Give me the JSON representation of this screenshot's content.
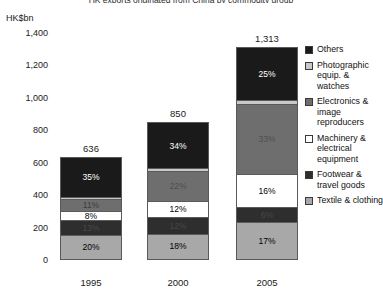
{
  "title": "HK exports originated from China by commodity group",
  "axis": {
    "unit_label": "HK$bn",
    "yticks": [
      "1,400",
      "1,200",
      "1,000",
      "800",
      "600",
      "400",
      "200",
      "0"
    ]
  },
  "legend": [
    {
      "label": "Others",
      "color": "#1a1a1a"
    },
    {
      "label": "Photographic equip. & watches",
      "color": "#c9c9c9"
    },
    {
      "label": "Electronics & image reproducers",
      "color": "#6e6e6e"
    },
    {
      "label": "Machinery & electrical equipment",
      "color": "#ffffff"
    },
    {
      "label": "Footwear & travel goods",
      "color": "#2e2e2e"
    },
    {
      "label": "Textile & clothing",
      "color": "#a8a8a8"
    }
  ],
  "bars": [
    {
      "year": "1995",
      "total": "636",
      "segments": [
        {
          "name": "Others",
          "label": "35%",
          "value": 35,
          "color": "#1a1a1a",
          "text_color": "#ffffff"
        },
        {
          "name": "Photographic equip. & watches",
          "label": "",
          "value": 2,
          "color": "#c9c9c9",
          "text_color": "#000000"
        },
        {
          "name": "Electronics & image reproducers",
          "label": "11%",
          "value": 11,
          "color": "#6e6e6e",
          "text_color": "#3d3d3d"
        },
        {
          "name": "Machinery & electrical equipment",
          "label": "8%",
          "value": 8,
          "color": "#ffffff",
          "text_color": "#000000"
        },
        {
          "name": "Footwear & travel goods",
          "label": "13%",
          "value": 13,
          "color": "#2e2e2e",
          "text_color": "#4a4a4a"
        },
        {
          "name": "Textile & clothing",
          "label": "20%",
          "value": 20,
          "color": "#a8a8a8",
          "text_color": "#000000"
        }
      ]
    },
    {
      "year": "2000",
      "total": "850",
      "segments": [
        {
          "name": "Others",
          "label": "34%",
          "value": 34,
          "color": "#1a1a1a",
          "text_color": "#ffffff"
        },
        {
          "name": "Photographic equip. & watches",
          "label": "",
          "value": 2,
          "color": "#c9c9c9",
          "text_color": "#000000"
        },
        {
          "name": "Electronics & image reproducers",
          "label": "22%",
          "value": 22,
          "color": "#6e6e6e",
          "text_color": "#4e4e4e"
        },
        {
          "name": "Machinery & electrical equipment",
          "label": "12%",
          "value": 12,
          "color": "#ffffff",
          "text_color": "#000000"
        },
        {
          "name": "Footwear & travel goods",
          "label": "12%",
          "value": 12,
          "color": "#2e2e2e",
          "text_color": "#474747"
        },
        {
          "name": "Textile & clothing",
          "label": "18%",
          "value": 18,
          "color": "#a8a8a8",
          "text_color": "#000000"
        }
      ]
    },
    {
      "year": "2005",
      "total": "1,313",
      "segments": [
        {
          "name": "Others",
          "label": "25%",
          "value": 25,
          "color": "#1a1a1a",
          "text_color": "#ffffff"
        },
        {
          "name": "Photographic equip. & watches",
          "label": "",
          "value": 2,
          "color": "#c9c9c9",
          "text_color": "#000000"
        },
        {
          "name": "Electronics & image reproducers",
          "label": "33%",
          "value": 33,
          "color": "#6e6e6e",
          "text_color": "#4e4e4e"
        },
        {
          "name": "Machinery & electrical equipment",
          "label": "16%",
          "value": 16,
          "color": "#ffffff",
          "text_color": "#000000"
        },
        {
          "name": "Footwear & travel goods",
          "label": "6%",
          "value": 7,
          "color": "#2e2e2e",
          "text_color": "#474747"
        },
        {
          "name": "Textile & clothing",
          "label": "17%",
          "value": 17,
          "color": "#a8a8a8",
          "text_color": "#000000"
        }
      ]
    }
  ],
  "chart_data": {
    "type": "bar",
    "title": "HK exports originated from China by commodity group",
    "xlabel": "",
    "ylabel": "HK$bn",
    "ylim": [
      0,
      1400
    ],
    "ytick_values": [
      0,
      200,
      400,
      600,
      800,
      1000,
      1200,
      1400
    ],
    "grid": false,
    "stacked": true,
    "legend_position": "right",
    "categories": [
      "1995",
      "2000",
      "2005"
    ],
    "totals": [
      636,
      850,
      1313
    ],
    "value_unit": "percent of bar total",
    "series": [
      {
        "name": "Textile & clothing",
        "values": [
          20,
          18,
          17
        ]
      },
      {
        "name": "Footwear & travel goods",
        "values": [
          13,
          12,
          6
        ]
      },
      {
        "name": "Machinery & electrical equipment",
        "values": [
          8,
          12,
          16
        ]
      },
      {
        "name": "Electronics & image reproducers",
        "values": [
          11,
          22,
          33
        ]
      },
      {
        "name": "Photographic equip. & watches",
        "values": [
          null,
          null,
          null
        ]
      },
      {
        "name": "Others",
        "values": [
          35,
          34,
          25
        ]
      }
    ],
    "annotations": [
      "636",
      "850",
      "1,313"
    ]
  }
}
